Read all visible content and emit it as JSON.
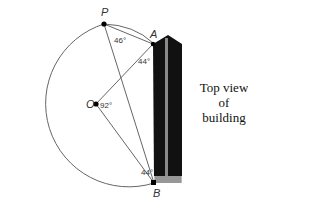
{
  "diagram": {
    "points": {
      "P": "P",
      "A": "A",
      "O": "O",
      "B": "B"
    },
    "angles": {
      "at_P": "46°",
      "at_A": "44°",
      "at_O": "92°",
      "at_B": "44°"
    },
    "caption": [
      "Top view",
      "of",
      "building"
    ],
    "colors": {
      "line": "#666666",
      "building": "#111111",
      "building_stripe": "#8a8a8a"
    }
  }
}
